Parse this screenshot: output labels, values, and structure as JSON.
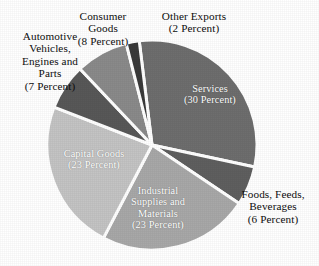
{
  "chart_data": {
    "type": "pie",
    "title": "",
    "labels": [
      "Services",
      "Foods, Feeds, Beverages",
      "Industrial Supplies and Materials",
      "Capital Goods",
      "Automotive Vehicles, Engines and Parts",
      "Consumer Goods",
      "Other Exports"
    ],
    "values": [
      30,
      6,
      23,
      23,
      7,
      8,
      2
    ],
    "value_unit": "Percent",
    "legend": "none",
    "slices": [
      {
        "name": "services",
        "label": "Services",
        "value": 30,
        "value_text": "(30 Percent)",
        "color": "#6e6e6e",
        "label_position": "inside"
      },
      {
        "name": "foods-feeds-beverages",
        "label": "Foods, Feeds,\nBeverages",
        "value": 6,
        "value_text": "(6 Percent)",
        "color": "#5f5f5f",
        "label_position": "outside"
      },
      {
        "name": "industrial-supplies-and-materials",
        "label": "Industrial\nSupplies and\nMaterials",
        "value": 23,
        "value_text": "(23 Percent)",
        "color": "#a8a8a8",
        "label_position": "inside"
      },
      {
        "name": "capital-goods",
        "label": "Capital Goods",
        "value": 23,
        "value_text": "(23 Percent)",
        "color": "#c4c4c4",
        "label_position": "inside"
      },
      {
        "name": "automotive-vehicles-engines-and-parts",
        "label": "Automotive\nVehicles,\nEngines and\nParts",
        "value": 7,
        "value_text": "(7 Percent)",
        "color": "#585858",
        "label_position": "outside"
      },
      {
        "name": "consumer-goods",
        "label": "Consumer\nGoods",
        "value": 8,
        "value_text": "(8 Percent)",
        "color": "#8a8a8a",
        "label_position": "outside"
      },
      {
        "name": "other-exports",
        "label": "Other Exports",
        "value": 2,
        "value_text": "(2 Percent)",
        "color": "#3a3a3a",
        "label_position": "outside"
      }
    ],
    "geometry": {
      "center_x": 152,
      "center_y": 145,
      "radius": 105,
      "start_angle_deg": -7,
      "separator_color": "#ffffff",
      "separator_width": 3
    }
  },
  "labels": {
    "services": {
      "name": "Services",
      "pct": "(30 Percent)"
    },
    "foods": {
      "name": "Foods, Feeds,\nBeverages",
      "pct": "(6 Percent)"
    },
    "industrial": {
      "name": "Industrial\nSupplies and\nMaterials",
      "pct": "(23 Percent)"
    },
    "capital": {
      "name": "Capital Goods",
      "pct": "(23 Percent)"
    },
    "automotive": {
      "name": "Automotive\nVehicles,\nEngines and\nParts",
      "pct": "(7 Percent)"
    },
    "consumer": {
      "name": "Consumer\nGoods",
      "pct": "(8 Percent)"
    },
    "other": {
      "name": "Other Exports",
      "pct": "(2 Percent)"
    }
  }
}
